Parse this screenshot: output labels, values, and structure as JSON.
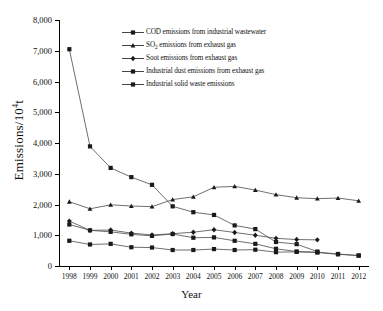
{
  "chart_data": {
    "type": "line",
    "title": "",
    "xlabel": "Year",
    "ylabel": "Emissions/10⁴t",
    "x": [
      1998,
      1999,
      2000,
      2001,
      2002,
      2003,
      2004,
      2005,
      2006,
      2007,
      2008,
      2009,
      2010,
      2011,
      2012
    ],
    "xlim": [
      1997.5,
      2012.5
    ],
    "ylim": [
      0,
      8000
    ],
    "yticks": [
      0,
      1000,
      2000,
      3000,
      4000,
      5000,
      6000,
      7000,
      8000
    ],
    "ytick_labels": [
      "0",
      "1,000",
      "2,000",
      "3,000",
      "4,000",
      "5,000",
      "6,000",
      "7,000",
      "8,000"
    ],
    "xtick_labels": [
      "1998",
      "1999",
      "2000",
      "2001",
      "2002",
      "2003",
      "2004",
      "2005",
      "2006",
      "2007",
      "2008",
      "2009",
      "2010",
      "2011",
      "2012"
    ],
    "grid": false,
    "legend_position": "upper-center",
    "series": [
      {
        "name": "COD emissions from industrial wastewater",
        "marker": "square",
        "x": [
          1998,
          1999,
          2000,
          2001,
          2002,
          2003,
          2004,
          2005,
          2006,
          2007,
          2008,
          2009,
          2010,
          2011,
          2012
        ],
        "values": [
          1350,
          1160,
          1110,
          1030,
          980,
          1040,
          920,
          930,
          820,
          720,
          560,
          470,
          450,
          390,
          340
        ]
      },
      {
        "name": "SO₂ emissions from exhaust gas",
        "marker": "triangle",
        "x": [
          1998,
          1999,
          2000,
          2001,
          2002,
          2003,
          2004,
          2005,
          2006,
          2007,
          2008,
          2009,
          2010,
          2011,
          2012
        ],
        "values": [
          2090,
          1860,
          1990,
          1950,
          1930,
          2160,
          2250,
          2560,
          2590,
          2470,
          2320,
          2220,
          2190,
          2210,
          2120
        ]
      },
      {
        "name": "Soot emissions from exhaust gas",
        "marker": "diamond",
        "x": [
          1998,
          1999,
          2000,
          2001,
          2002,
          2003,
          2004,
          2005,
          2006,
          2007,
          2008,
          2009,
          2010
        ],
        "values": [
          1460,
          1160,
          1170,
          1070,
          1010,
          1050,
          1100,
          1180,
          1090,
          1000,
          900,
          860,
          850
        ]
      },
      {
        "name": "Industrial dust emissions from exhaust gas",
        "marker": "square",
        "x": [
          1998,
          1999,
          2000,
          2001,
          2002,
          2003,
          2004,
          2005,
          2006,
          2007,
          2008,
          2009,
          2010,
          2011,
          2012
        ],
        "values": [
          820,
          700,
          720,
          610,
          600,
          520,
          520,
          550,
          520,
          530,
          450,
          460,
          440,
          380,
          340
        ]
      },
      {
        "name": "Industrial solid waste emissions",
        "marker": "square",
        "x": [
          1998,
          1999,
          2000,
          2001,
          2002,
          2003,
          2004,
          2005,
          2006,
          2007,
          2008,
          2009,
          2010
        ],
        "values": [
          7050,
          3890,
          3190,
          2890,
          2640,
          1940,
          1750,
          1660,
          1320,
          1200,
          780,
          710,
          470
        ]
      }
    ]
  },
  "legend": {
    "items": [
      {
        "label_pre": "COD emissions from industrial wastewater",
        "sub": "",
        "label_post": ""
      },
      {
        "label_pre": "SO",
        "sub": "2",
        "label_post": " emissions from exhaust gas"
      },
      {
        "label_pre": "Soot emissions from exhaust gas",
        "sub": "",
        "label_post": ""
      },
      {
        "label_pre": "Industrial dust emissions from exhaust gas",
        "sub": "",
        "label_post": ""
      },
      {
        "label_pre": "Industrial solid waste emissions",
        "sub": "",
        "label_post": ""
      }
    ]
  },
  "axis": {
    "y_title_pre": "Emissions/10",
    "y_title_sup": "4",
    "y_title_post": "t",
    "x_title": "Year"
  },
  "colors": {
    "line": "#4a4a4a",
    "marker": "#1a1a1a",
    "axis": "#000000"
  }
}
